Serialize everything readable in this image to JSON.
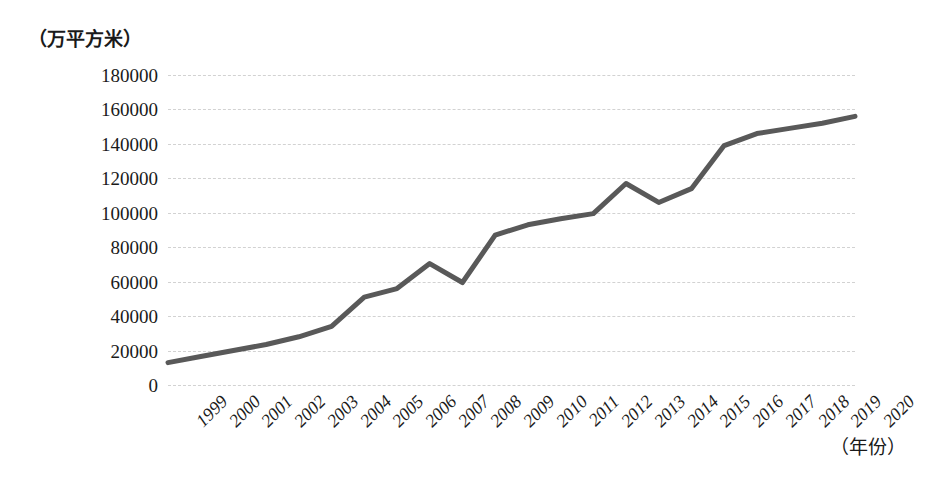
{
  "chart_data": {
    "type": "line",
    "title": "",
    "xlabel": "（年份）",
    "ylabel": "（万平方米）",
    "x": [
      "1999",
      "2000",
      "2001",
      "2002",
      "2003",
      "2004",
      "2005",
      "2006",
      "2007",
      "2008",
      "2009",
      "2010",
      "2011",
      "2012",
      "2013",
      "2014",
      "2015",
      "2016",
      "2017",
      "2018",
      "2019",
      "2020"
    ],
    "values": [
      13000,
      16500,
      20000,
      23500,
      28000,
      34000,
      51000,
      56000,
      70500,
      59500,
      87000,
      93000,
      96500,
      99500,
      117000,
      106000,
      114000,
      139000,
      146000,
      149000,
      152000,
      156000
    ],
    "series": [
      {
        "name": "住宅竣工面积",
        "values": [
          13000,
          16500,
          20000,
          23500,
          28000,
          34000,
          51000,
          56000,
          70500,
          59500,
          87000,
          93000,
          96500,
          99500,
          117000,
          106000,
          114000,
          139000,
          146000,
          149000,
          152000,
          156000
        ]
      }
    ],
    "ylim": [
      0,
      180000
    ],
    "yticks": [
      "0",
      "20000",
      "40000",
      "60000",
      "80000",
      "100000",
      "120000",
      "140000",
      "160000",
      "180000"
    ],
    "ytick_values": [
      0,
      20000,
      40000,
      60000,
      80000,
      100000,
      120000,
      140000,
      160000,
      180000
    ],
    "grid": true,
    "gridline_style": "dashed",
    "legend": "none",
    "line_color": "#595959",
    "line_width": 5,
    "markers": false,
    "background": "#ffffff"
  }
}
